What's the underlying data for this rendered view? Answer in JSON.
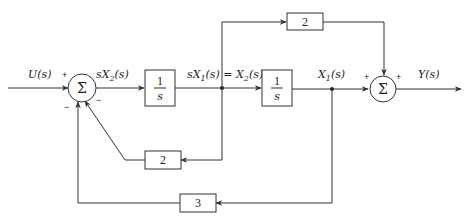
{
  "diagram": {
    "type": "block-diagram",
    "signals": {
      "input": "U(s)",
      "after_sum1": "sX",
      "after_sum1_sub": "2",
      "after_sum1_tail": "(s)",
      "mid_a": "sX",
      "mid_a_sub": "1",
      "mid_a_tail": "(s) = X",
      "mid_b_sub": "2",
      "mid_b_tail": "(s)",
      "state": "X",
      "state_sub": "1",
      "state_tail": "(s)",
      "output": "Y(s)"
    },
    "summing_junctions": [
      {
        "id": "sum1",
        "symbol": "Σ",
        "signs": {
          "input": "+",
          "feedback_top": "−",
          "feedback_bottom": "−"
        }
      },
      {
        "id": "sum2",
        "symbol": "Σ",
        "signs": {
          "left": "+",
          "top": "+"
        }
      }
    ],
    "blocks": [
      {
        "id": "integrator1",
        "numerator": "1",
        "denominator": "s"
      },
      {
        "id": "integrator2",
        "numerator": "1",
        "denominator": "s"
      },
      {
        "id": "feedforward_gain",
        "value": "2"
      },
      {
        "id": "feedback_gain_inner",
        "value": "2"
      },
      {
        "id": "feedback_gain_outer",
        "value": "3"
      }
    ]
  }
}
